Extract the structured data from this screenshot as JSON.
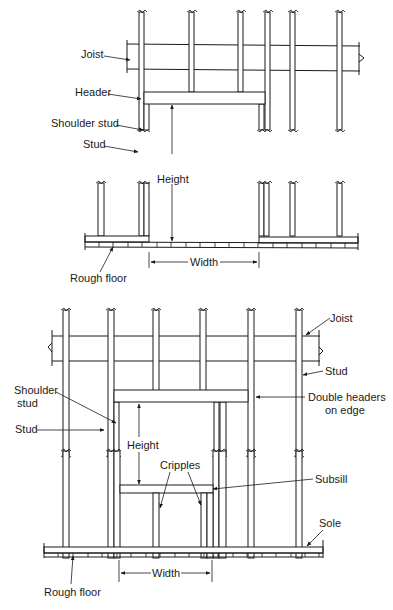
{
  "figure": {
    "top": {
      "labels": {
        "joist": "Joist",
        "header": "Header",
        "shoulder_stud": "Shoulder stud",
        "stud": "Stud",
        "height": "Height",
        "width": "Width",
        "rough_floor": "Rough floor"
      }
    },
    "bottom": {
      "labels": {
        "joist": "Joist",
        "stud_right": "Stud",
        "shoulder_stud_line1": "Shoulder",
        "shoulder_stud_line2": "stud",
        "stud_left": "Stud",
        "double_headers_line1": "Double headers",
        "double_headers_line2": "on edge",
        "height": "Height",
        "cripples": "Cripples",
        "subsill": "Subsill",
        "sole": "Sole",
        "width": "Width",
        "rough_floor": "Rough floor"
      }
    }
  }
}
